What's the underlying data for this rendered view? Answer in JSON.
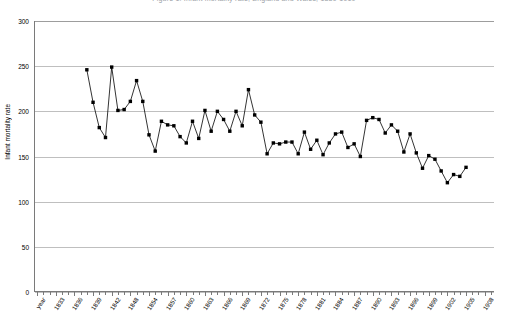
{
  "chart": {
    "title": "Figure 1. Infant mortality rate, England and Wales, 1839-1910",
    "y_axis_title": "Infant mortality rate",
    "x_axis_title": "",
    "y_ticks": [
      "0",
      "50",
      "100",
      "150",
      "200",
      "250",
      "300"
    ],
    "x_labels": [
      "year",
      "1833",
      "1836",
      "1839",
      "1842",
      "1845",
      "1848",
      "1851",
      "1854",
      "1857",
      "1860",
      "1863",
      "1866",
      "1869",
      "1872",
      "1875",
      "1878",
      "1881",
      "1884",
      "1887",
      "1890",
      "1893",
      "1896",
      "1899",
      "1902",
      "1905",
      "1908"
    ],
    "x_labels_visible": [
      "year",
      "1833",
      "1836",
      "1839",
      "1842",
      "1848",
      "1854",
      "1857",
      "1860",
      "1863",
      "1866",
      "1869",
      "1872",
      "1875",
      "1878",
      "1881",
      "1884",
      "1887",
      "1890",
      "1893",
      "1896",
      "1899",
      "1902",
      "1905",
      "1908"
    ],
    "marker_color": "#000000",
    "line_color": "#000000",
    "grid_color": "#bfbfbf",
    "axis_color": "#7a7a7a"
  },
  "chart_data": {
    "type": "line",
    "title": "Figure 1. Infant mortality rate, England and Wales, 1839-1910",
    "xlabel": "year",
    "ylabel": "Infant mortality rate",
    "ylim": [
      0,
      300
    ],
    "ytick_step": 50,
    "grid": true,
    "legend": "none",
    "marker": "square",
    "x_tick_label_interval_years": 3,
    "x_tick_label_start": 1833,
    "x": [
      1839,
      1840,
      1841,
      1842,
      1843,
      1844,
      1845,
      1846,
      1847,
      1848,
      1849,
      1850,
      1851,
      1852,
      1853,
      1854,
      1855,
      1856,
      1857,
      1858,
      1859,
      1860,
      1861,
      1862,
      1863,
      1864,
      1865,
      1866,
      1867,
      1868,
      1869,
      1870,
      1871,
      1872,
      1873,
      1874,
      1875,
      1876,
      1877,
      1878,
      1879,
      1880,
      1881,
      1882,
      1883,
      1884,
      1885,
      1886,
      1887,
      1888,
      1889,
      1890,
      1891,
      1892,
      1893,
      1894,
      1895,
      1896,
      1897,
      1898,
      1899,
      1900,
      1901,
      1902,
      1903,
      1904,
      1905,
      1906,
      1907,
      1908,
      1909,
      1910
    ],
    "y": [
      246,
      210,
      182,
      171,
      249,
      201,
      202,
      211,
      234,
      211,
      174,
      156,
      189,
      185,
      184,
      172,
      165,
      189,
      170,
      201,
      178,
      200,
      191,
      178,
      200,
      184,
      224,
      196,
      188,
      153,
      165,
      164,
      166,
      166,
      153,
      177,
      158,
      168,
      152,
      165,
      175,
      177,
      160,
      164,
      150,
      190,
      193,
      191,
      176,
      185,
      178,
      155,
      175,
      154,
      137,
      151,
      147,
      134,
      121,
      130,
      128,
      138
    ]
  }
}
